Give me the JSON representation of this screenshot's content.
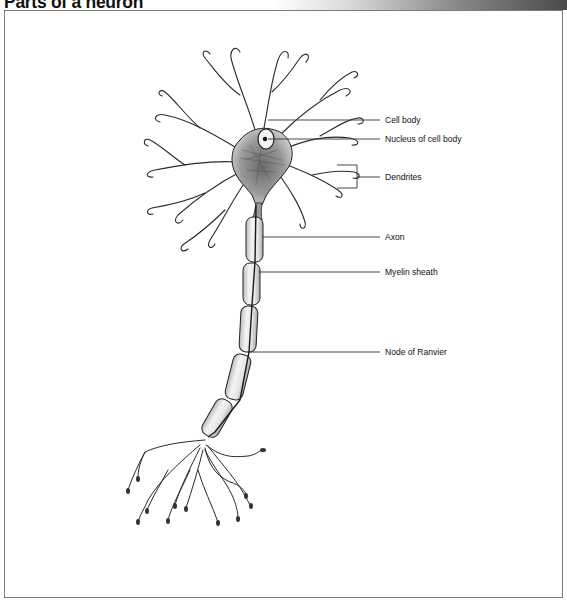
{
  "title": "Parts of a neuron",
  "labels": [
    {
      "id": "cell-body",
      "text": "Cell body",
      "x": 385,
      "y": 120
    },
    {
      "id": "nucleus",
      "text": "Nucleus of cell body",
      "x": 385,
      "y": 139
    },
    {
      "id": "dendrites",
      "text": "Dendrites",
      "x": 385,
      "y": 177
    },
    {
      "id": "axon",
      "text": "Axon",
      "x": 385,
      "y": 237
    },
    {
      "id": "myelin-sheath",
      "text": "Myelin sheath",
      "x": 385,
      "y": 272
    },
    {
      "id": "node-of-ranvier",
      "text": "Node of Ranvier",
      "x": 385,
      "y": 352
    }
  ],
  "colors": {
    "frame": "#7a7a7a",
    "ink": "#222222",
    "leader_line": "#333333"
  }
}
